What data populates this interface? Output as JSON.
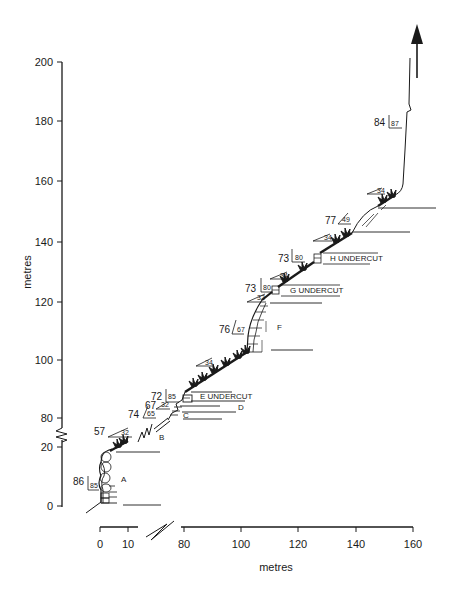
{
  "figure": {
    "type": "cross-section profile",
    "y_axis": {
      "label": "metres",
      "upper_ticks": [
        "200",
        "180",
        "160",
        "140",
        "120",
        "100",
        "80"
      ],
      "lower_ticks": [
        "20",
        "0"
      ],
      "has_break": true
    },
    "x_axis": {
      "label": "metres",
      "left_ticks": [
        "0",
        "10"
      ],
      "right_ticks": [
        "80",
        "100",
        "120",
        "140",
        "160"
      ],
      "has_break": true
    },
    "units": {
      "A": "A",
      "B": "B",
      "C": "C",
      "D": "D",
      "E": "E UNDERCUT",
      "F": "F",
      "G": "G UNDERCUT",
      "H": "H UNDERCUT"
    },
    "attitudes": {
      "a86": {
        "strike": "86",
        "dip": "85"
      },
      "a57": {
        "strike": "57",
        "dip": "32"
      },
      "a74": {
        "strike": "74",
        "dip": "65"
      },
      "a67": {
        "strike": "67",
        "dip": "32"
      },
      "a72": {
        "strike": "72",
        "dip": "85"
      },
      "s34a": {
        "dip": "34"
      },
      "a76": {
        "strike": "76",
        "dip": "67"
      },
      "s32": {
        "dip": "32"
      },
      "a73g": {
        "strike": "73",
        "dip": "80"
      },
      "s34b": {
        "dip": "34"
      },
      "a73h": {
        "strike": "73",
        "dip": "80"
      },
      "s34c": {
        "dip": "34"
      },
      "a77": {
        "strike": "77",
        "dip": "49"
      },
      "s34d": {
        "dip": "34"
      },
      "a84": {
        "strike": "84",
        "dip": "87"
      }
    },
    "icons": {
      "arrow": "up-arrow-icon",
      "vegetation": "vegetation-tuft-icon"
    }
  }
}
